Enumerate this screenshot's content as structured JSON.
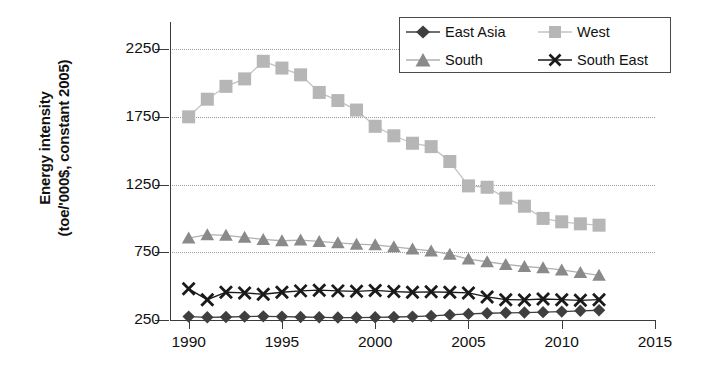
{
  "chart_data": {
    "type": "line",
    "title": "",
    "xlabel": "",
    "ylabel": "Energy intensity (toe/'000$, constant 2005)",
    "ylabel_line1": "Energy intensity",
    "ylabel_line2": "(toe/'000$, constant 2005)",
    "xlim": [
      1989,
      2015
    ],
    "ylim": [
      250,
      2450
    ],
    "yticks": [
      250,
      750,
      1250,
      1750,
      2250
    ],
    "ytick_labels": [
      "250",
      "750",
      "1250",
      "1750",
      "2250"
    ],
    "xticks": [
      1990,
      1995,
      2000,
      2005,
      2010,
      2015
    ],
    "xtick_labels": [
      "1990",
      "1995",
      "2000",
      "2005",
      "2010",
      "2015"
    ],
    "grid": "horizontal-dotted",
    "legend_position": "top-right",
    "x": [
      1990,
      1991,
      1992,
      1993,
      1994,
      1995,
      1996,
      1997,
      1998,
      1999,
      2000,
      2001,
      2002,
      2003,
      2004,
      2005,
      2006,
      2007,
      2008,
      2009,
      2010,
      2011,
      2012
    ],
    "series": [
      {
        "name": "East Asia",
        "marker": "diamond",
        "color": "#3f3f3f",
        "values": [
          275,
          270,
          272,
          275,
          277,
          275,
          272,
          270,
          268,
          268,
          270,
          272,
          275,
          280,
          288,
          295,
          300,
          303,
          305,
          308,
          312,
          318,
          322
        ]
      },
      {
        "name": "West",
        "marker": "square",
        "color": "#b6b6b6",
        "values": [
          1750,
          1880,
          1975,
          2030,
          2160,
          2110,
          2060,
          1930,
          1870,
          1800,
          1680,
          1610,
          1555,
          1530,
          1420,
          1240,
          1230,
          1150,
          1090,
          1000,
          975,
          960,
          950
        ]
      },
      {
        "name": "South",
        "marker": "triangle",
        "color": "#8a8a8a",
        "values": [
          855,
          880,
          875,
          860,
          845,
          835,
          840,
          830,
          820,
          810,
          805,
          790,
          775,
          760,
          735,
          700,
          680,
          660,
          645,
          635,
          620,
          600,
          580
        ]
      },
      {
        "name": "South East",
        "marker": "cross",
        "color": "#1a1a1a",
        "values": [
          480,
          400,
          455,
          450,
          440,
          455,
          465,
          470,
          465,
          462,
          468,
          460,
          455,
          458,
          455,
          450,
          420,
          400,
          398,
          405,
          400,
          395,
          400
        ]
      }
    ]
  },
  "legend": {
    "items": [
      {
        "label": "East Asia",
        "marker": "diamond",
        "color": "#3f3f3f"
      },
      {
        "label": "West",
        "marker": "square",
        "color": "#b6b6b6"
      },
      {
        "label": "South",
        "marker": "triangle",
        "color": "#8a8a8a"
      },
      {
        "label": "South East",
        "marker": "cross",
        "color": "#1a1a1a"
      }
    ]
  }
}
